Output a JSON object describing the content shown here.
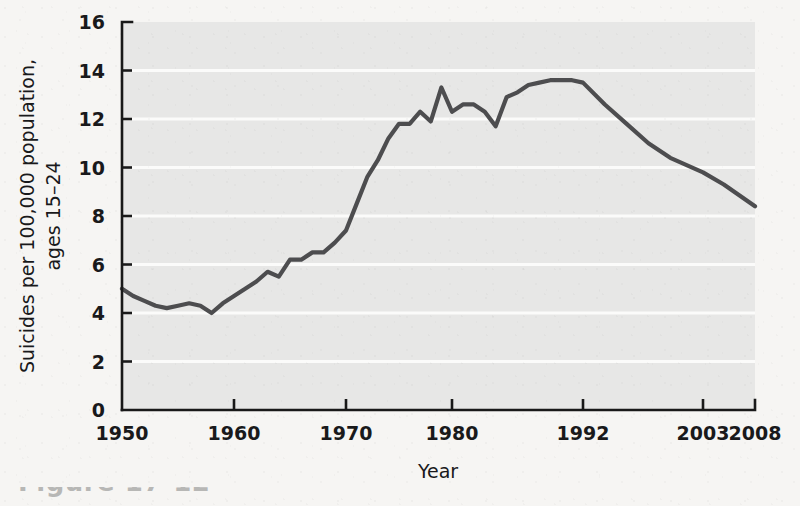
{
  "figure": {
    "background_color": "#f6f5f3",
    "plot_background_color": "#e7e7e6",
    "gridline_color": "#fbfbfa",
    "line_color": "#4d4d4f",
    "axis_color": "#191919",
    "caption_fragment": "Figure 17-12"
  },
  "chart_data": {
    "type": "line",
    "title": "",
    "xlabel": "Year",
    "ylabel": "Suicides per 100,000 population, ages 15–24",
    "ylabel_line1": "Suicides per 100,000 population,",
    "ylabel_line2": "ages 15–24",
    "xlim": [
      1950,
      2008
    ],
    "ylim": [
      0,
      16
    ],
    "grid": true,
    "grid_axis": "y",
    "legend": false,
    "legend_position": "none",
    "ytick_labels": [
      "0",
      "2",
      "4",
      "6",
      "8",
      "10",
      "12",
      "14",
      "16"
    ],
    "ytick_values": [
      0,
      2,
      4,
      6,
      8,
      10,
      12,
      14,
      16
    ],
    "xtick_labels": [
      "1950",
      "1960",
      "1970",
      "1980",
      "1992",
      "2003",
      "2008"
    ],
    "xtick_values": [
      1950,
      1960,
      1970,
      1980,
      1992,
      2003,
      2008
    ],
    "series": [
      {
        "name": "Suicide rate, ages 15-24",
        "x": [
          1950,
          1951,
          1952,
          1953,
          1954,
          1955,
          1956,
          1957,
          1958,
          1959,
          1960,
          1961,
          1962,
          1963,
          1964,
          1965,
          1966,
          1967,
          1968,
          1969,
          1970,
          1971,
          1972,
          1973,
          1974,
          1975,
          1976,
          1977,
          1978,
          1979,
          1980,
          1981,
          1982,
          1983,
          1984,
          1985,
          1986,
          1987,
          1988,
          1989,
          1990,
          1991,
          1992,
          1994,
          1996,
          1998,
          2000,
          2003,
          2005,
          2008
        ],
        "values": [
          5.0,
          4.7,
          4.5,
          4.3,
          4.2,
          4.3,
          4.4,
          4.3,
          4.0,
          4.4,
          4.7,
          5.0,
          5.3,
          5.7,
          5.5,
          6.2,
          6.2,
          6.5,
          6.5,
          6.9,
          7.4,
          8.5,
          9.6,
          10.3,
          11.2,
          11.8,
          11.8,
          12.3,
          11.9,
          13.3,
          12.3,
          12.6,
          12.6,
          12.3,
          11.7,
          12.9,
          13.1,
          13.4,
          13.5,
          13.6,
          13.6,
          13.6,
          13.5,
          12.6,
          11.8,
          11.0,
          10.4,
          9.8,
          9.3,
          8.4
        ]
      }
    ],
    "annotations": [
      {
        "text": "Peak plateau near 13.6 around 1989–1992"
      },
      {
        "text": "Low point near 4.0 in 1958"
      },
      {
        "text": "Ends near 8.4 in 2008"
      }
    ]
  },
  "axes": {
    "y_axis_label": "Suicides per 100,000 population, ages 15–24",
    "x_axis_label": "Year"
  }
}
